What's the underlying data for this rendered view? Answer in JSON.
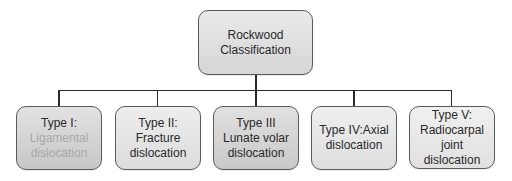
{
  "diagram": {
    "type": "tree",
    "root": {
      "line1": "Rockwood",
      "line2": "Classification"
    },
    "children": [
      {
        "title": "Type I:",
        "desc_line1": "Ligamental",
        "desc_line2": "dislocation",
        "desc_faded": true
      },
      {
        "title": "Type II:",
        "desc_line1": "Fracture",
        "desc_line2": "dislocation",
        "desc_faded": false
      },
      {
        "title": "Type III",
        "desc_line1": "Lunate volar",
        "desc_line2": "dislocation",
        "desc_faded": false
      },
      {
        "title": "Type IV:Axial",
        "desc_line1": "dislocation",
        "desc_line2": "",
        "desc_faded": false
      },
      {
        "title": "Type V:",
        "desc_line1": "Radiocarpal",
        "desc_line2": "joint",
        "desc_line3": "dislocation",
        "desc_faded": false
      }
    ],
    "colors": {
      "border": "#5a5a5a",
      "connector": "#2a2a2a",
      "text": "#2a2a2a",
      "faded_text": "#a8a8a8"
    }
  }
}
